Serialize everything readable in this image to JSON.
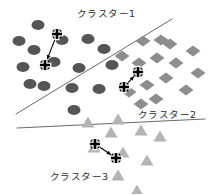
{
  "figure": {
    "title": "",
    "background_color": "#ffffff",
    "width": 215,
    "height": 194
  },
  "labels": {
    "cluster1": "クラスター1",
    "cluster2": "クラスター2",
    "cluster3": "クラスター3"
  },
  "label_positions": {
    "cluster1": {
      "x": 77,
      "y": 9
    },
    "cluster2": {
      "x": 138,
      "y": 110
    },
    "cluster3": {
      "x": 50,
      "y": 172
    }
  },
  "colors": {
    "cluster1_marker": "#555555",
    "cluster2_marker": "#8d8d8d",
    "cluster3_marker": "#b4b4b4",
    "boundary_line": "#6a6a6a",
    "centroid_fill": "#000000",
    "centroid_stroke": "#ffffff",
    "arrow": "#000000",
    "label_text": "#2b2b2b"
  },
  "chart_data": {
    "type": "scatter",
    "title": "",
    "xlabel": "",
    "ylabel": "",
    "grid": false,
    "legend": "none",
    "axis_visible": false,
    "xlim": [
      0,
      215
    ],
    "ylim": [
      0,
      194
    ],
    "note": "Pixel coordinates, y increases downward (image space).",
    "series": [
      {
        "name": "クラスター1",
        "marker": "ellipse",
        "color": "#555555",
        "marker_size": {
          "rx": 6.5,
          "ry": 5.0
        },
        "points": [
          {
            "x": 38,
            "y": 25
          },
          {
            "x": 19,
            "y": 41
          },
          {
            "x": 34,
            "y": 50
          },
          {
            "x": 62,
            "y": 40
          },
          {
            "x": 88,
            "y": 39
          },
          {
            "x": 54,
            "y": 62
          },
          {
            "x": 79,
            "y": 68
          },
          {
            "x": 23,
            "y": 67
          },
          {
            "x": 30,
            "y": 84
          },
          {
            "x": 44,
            "y": 86
          },
          {
            "x": 72,
            "y": 88
          },
          {
            "x": 99,
            "y": 89
          },
          {
            "x": 74,
            "y": 110
          },
          {
            "x": 112,
            "y": 65
          },
          {
            "x": 104,
            "y": 49
          }
        ],
        "centroids": [
          {
            "x": 57,
            "y": 34
          },
          {
            "x": 45,
            "y": 65
          }
        ],
        "centroid_arrow": {
          "from": {
            "x": 57,
            "y": 34
          },
          "to": {
            "x": 45,
            "y": 65
          }
        }
      },
      {
        "name": "クラスター2",
        "marker": "diamond",
        "color": "#8d8d8d",
        "marker_size": {
          "r": 7.5
        },
        "points": [
          {
            "x": 143,
            "y": 41
          },
          {
            "x": 161,
            "y": 40
          },
          {
            "x": 157,
            "y": 58
          },
          {
            "x": 176,
            "y": 63
          },
          {
            "x": 193,
            "y": 51
          },
          {
            "x": 139,
            "y": 63
          },
          {
            "x": 166,
            "y": 78
          },
          {
            "x": 147,
            "y": 85
          },
          {
            "x": 186,
            "y": 90
          },
          {
            "x": 129,
            "y": 92
          },
          {
            "x": 156,
            "y": 99
          },
          {
            "x": 141,
            "y": 104
          },
          {
            "x": 170,
            "y": 44
          },
          {
            "x": 122,
            "y": 56
          },
          {
            "x": 198,
            "y": 73
          }
        ],
        "centroids": [
          {
            "x": 138,
            "y": 72
          },
          {
            "x": 124,
            "y": 87
          }
        ],
        "centroid_arrow": {
          "from": {
            "x": 124,
            "y": 87
          },
          "to": {
            "x": 138,
            "y": 72
          }
        }
      },
      {
        "name": "クラスター3",
        "marker": "triangle",
        "color": "#b4b4b4",
        "marker_size": {
          "w": 13,
          "h": 11
        },
        "points": [
          {
            "x": 88,
            "y": 122
          },
          {
            "x": 118,
            "y": 119
          },
          {
            "x": 111,
            "y": 132
          },
          {
            "x": 141,
            "y": 130
          },
          {
            "x": 94,
            "y": 147
          },
          {
            "x": 123,
            "y": 152
          },
          {
            "x": 147,
            "y": 160
          },
          {
            "x": 118,
            "y": 175
          },
          {
            "x": 137,
            "y": 190
          },
          {
            "x": 160,
            "y": 136
          }
        ],
        "centroids": [
          {
            "x": 95,
            "y": 144
          },
          {
            "x": 116,
            "y": 158
          }
        ],
        "centroid_arrow": {
          "from": {
            "x": 95,
            "y": 144
          },
          "to": {
            "x": 116,
            "y": 158
          }
        }
      }
    ],
    "boundaries": [
      {
        "name": "diagonal-boundary",
        "x1": 16,
        "y1": 114,
        "x2": 172,
        "y2": 19
      },
      {
        "name": "horizontal-boundary",
        "x1": 17,
        "y1": 128,
        "x2": 205,
        "y2": 119
      }
    ]
  }
}
